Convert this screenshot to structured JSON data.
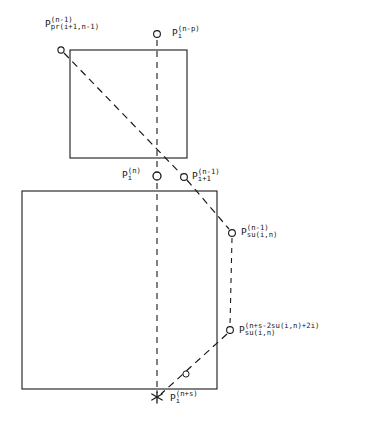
{
  "figure": {
    "type": "point-lattice-diagram",
    "background_color": "#ffffff",
    "line_color": "#1a1a1a",
    "boxes": [
      {
        "name": "upper-box",
        "x": 70,
        "y": 50,
        "width": 117,
        "height": 108
      },
      {
        "name": "lower-box",
        "x": 22,
        "y": 191,
        "width": 195,
        "height": 198
      }
    ],
    "markers": [
      {
        "name": "p-pr-node",
        "shape": "circle",
        "x": 61,
        "y": 50
      },
      {
        "name": "p-i-n-minus-p",
        "shape": "circle",
        "x": 157,
        "y": 34
      },
      {
        "name": "p-i-n",
        "shape": "circle",
        "x": 157,
        "y": 176
      },
      {
        "name": "p-i-plus-1",
        "shape": "circle",
        "x": 184,
        "y": 177
      },
      {
        "name": "p-su-upper",
        "shape": "circle",
        "x": 232,
        "y": 233
      },
      {
        "name": "p-su-lower",
        "shape": "circle",
        "x": 230,
        "y": 330
      },
      {
        "name": "p-mid-small",
        "shape": "circle",
        "x": 186,
        "y": 374
      },
      {
        "name": "p-i-n-plus-s",
        "shape": "asterisk",
        "x": 157,
        "y": 397
      }
    ],
    "lines": [
      {
        "name": "vertical-dashed-axis",
        "style": "dashed",
        "from": [
          157,
          34
        ],
        "to": [
          157,
          397
        ]
      },
      {
        "name": "diagonal-dashed-upper",
        "style": "dashed",
        "from": [
          61,
          50
        ],
        "to": [
          184,
          177
        ]
      },
      {
        "name": "diagonal-dashed-to-su",
        "style": "dashed",
        "from": [
          184,
          177
        ],
        "to": [
          232,
          233
        ]
      },
      {
        "name": "vertical-dashed-right",
        "style": "dashed",
        "from": [
          232,
          233
        ],
        "to": [
          230,
          330
        ]
      },
      {
        "name": "diagonal-dashed-lower",
        "style": "dashed",
        "from": [
          230,
          330
        ],
        "to": [
          157,
          397
        ]
      }
    ]
  },
  "labels": {
    "p_pr": {
      "base": "P",
      "sup": "(n-1)",
      "sub": "pr(i+1,n-1)"
    },
    "p_i_n_minus_p": {
      "base": "P",
      "sup": "(n-p)",
      "sub": "i"
    },
    "p_i_n": {
      "base": "P",
      "sup": "(n)",
      "sub": "i"
    },
    "p_i_plus_1": {
      "base": "P",
      "sup": "(n-1)",
      "sub": "i+1"
    },
    "p_su_upper": {
      "base": "P",
      "sup": "(n-1)",
      "sub": "su(i,n)"
    },
    "p_su_lower": {
      "base": "P",
      "sup": "(n+s-2su(i,n)+2i)",
      "sub": "su(i,n)"
    },
    "p_i_n_plus_s": {
      "base": "P",
      "sup": "(n+s)",
      "sub": "i"
    }
  }
}
